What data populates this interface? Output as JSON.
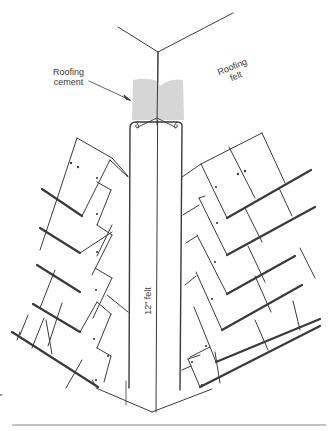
{
  "figure": {
    "type": "technical illustration",
    "labels": {
      "cement_line1": "Roofing",
      "cement_line2": "cement",
      "felt_line1": "Roofing",
      "felt_line2": "felt",
      "strip": "12\" felt"
    },
    "colors": {
      "line": "#3a3a3a",
      "cement": "#d6d6d6",
      "background": "#ffffff",
      "rule": "#8a8a8a"
    }
  }
}
